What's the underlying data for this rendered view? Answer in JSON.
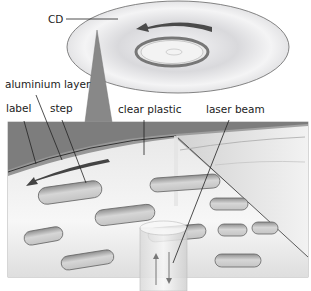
{
  "diagram": {
    "type": "cross-section illustration",
    "labels": {
      "cd": "CD",
      "aluminium_layer": "aluminium layer",
      "label": "label",
      "step": "step",
      "clear_plastic": "clear plastic",
      "laser_beam": "laser beam"
    },
    "elements": [
      {
        "id": "cd-disc",
        "description": "Compact disc drawn in perspective with rotation arrow"
      },
      {
        "id": "rotation-arrow",
        "description": "Dark arrow on disc showing direction of spin"
      },
      {
        "id": "cutaway-box",
        "description": "Enlarged cutaway cross-section of disc surface"
      },
      {
        "id": "pits",
        "description": "Rounded oblong steps (pits) in the aluminium layer"
      },
      {
        "id": "laser-cylinder",
        "description": "Laser beam column with up and down arrows showing reflection"
      }
    ],
    "colors": {
      "disc_fill": "#e8e8ea",
      "disc_edge": "#555555",
      "layer_dark": "#7a7a7a",
      "plastic_light": "#d8d8d8",
      "pit_fill": "#bdbdbd",
      "arrow": "#444444"
    }
  }
}
